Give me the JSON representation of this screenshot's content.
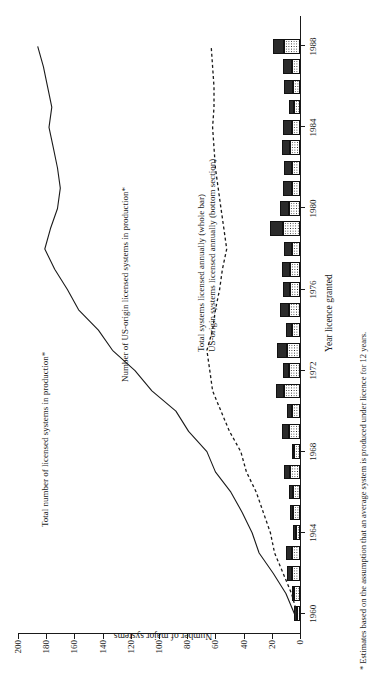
{
  "chart_data": {
    "type": "bar",
    "title": "",
    "subtitle": "",
    "xlabel": "Year licence granted",
    "ylabel": "Number of major systems",
    "xlim": [
      1959,
      1989.5
    ],
    "ylim": [
      0,
      200
    ],
    "grid": false,
    "legend_position": "inline-annotations",
    "x_tick_labels": [
      "1960",
      "1964",
      "1968",
      "1972",
      "1976",
      "1980",
      "1984",
      "1988"
    ],
    "x_tick_values": [
      1960,
      1964,
      1968,
      1972,
      1976,
      1980,
      1984,
      1988
    ],
    "y_tick_labels": [
      "0",
      "20",
      "40",
      "60",
      "80",
      "100",
      "120",
      "140",
      "160",
      "180",
      "200"
    ],
    "y_tick_values": [
      0,
      20,
      40,
      60,
      80,
      100,
      120,
      140,
      160,
      180,
      200
    ],
    "years": [
      1960,
      1961,
      1962,
      1963,
      1964,
      1965,
      1966,
      1967,
      1968,
      1969,
      1970,
      1971,
      1972,
      1973,
      1974,
      1975,
      1976,
      1977,
      1978,
      1979,
      1980,
      1981,
      1982,
      1983,
      1984,
      1985,
      1986,
      1987,
      1988
    ],
    "series": [
      {
        "name": "Total systems licensed annually (whole bar)",
        "type": "bar",
        "style": "solid-dark-top-of-stack",
        "values": [
          4,
          6,
          9,
          10,
          5,
          7,
          8,
          11,
          6,
          13,
          9,
          17,
          12,
          16,
          10,
          14,
          12,
          13,
          11,
          21,
          14,
          12,
          11,
          13,
          12,
          8,
          11,
          12,
          19
        ]
      },
      {
        "name": "US-origin systems licensed annually (bottom section)",
        "type": "bar",
        "style": "stippled-bottom-of-stack",
        "values": [
          2,
          4,
          6,
          6,
          3,
          5,
          5,
          7,
          4,
          8,
          6,
          11,
          8,
          9,
          6,
          8,
          7,
          7,
          6,
          12,
          8,
          6,
          6,
          7,
          6,
          4,
          5,
          6,
          11
        ]
      },
      {
        "name": "Total number of licensed systems in production*",
        "type": "line",
        "style": "solid",
        "values": [
          4,
          10,
          19,
          29,
          34,
          41,
          49,
          60,
          66,
          79,
          88,
          105,
          117,
          133,
          143,
          157,
          165,
          174,
          181,
          177,
          172,
          170,
          172,
          175,
          178,
          176,
          179,
          182,
          186
        ]
      },
      {
        "name": "Number of US-origin licensed systems in production*",
        "type": "line",
        "style": "dashed",
        "values": [
          2,
          6,
          12,
          18,
          21,
          26,
          31,
          38,
          42,
          50,
          56,
          62,
          64,
          66,
          62,
          60,
          57,
          55,
          52,
          54,
          56,
          58,
          60,
          61,
          62,
          61,
          61,
          62,
          63
        ]
      }
    ],
    "annotations": [
      "Total number of licensed systems in production*",
      "Number of US-origin licensed systems in production*",
      "Total systems licensed annually (whole bar)",
      "US-origin systems licensed annually (bottom section)"
    ],
    "footnote": "* Estimates based on the assumption that an average system is produced under licence for 12 years.",
    "colors": {
      "bar_total": "#2b2b2b",
      "bar_us_fill": "#ffffff",
      "bar_us_dots": "#222222",
      "line_total": "#1a1a1a",
      "line_us": "#1a1a1a",
      "axis": "#1a1a1a",
      "background": "#ffffff"
    }
  },
  "labels": {
    "annot_total_production": "Total number of licensed systems in production*",
    "annot_us_production": "Number of US-origin licensed systems in production*",
    "annot_bar_total": "Total systems licensed annually (whole bar)",
    "annot_bar_us": "US-origin systems licensed annually (bottom section)",
    "x_axis_title": "Year licence granted",
    "y_axis_title": "Number of major systems",
    "footnote": "* Estimates based on the assumption that an average system is produced under licence for 12 years."
  }
}
